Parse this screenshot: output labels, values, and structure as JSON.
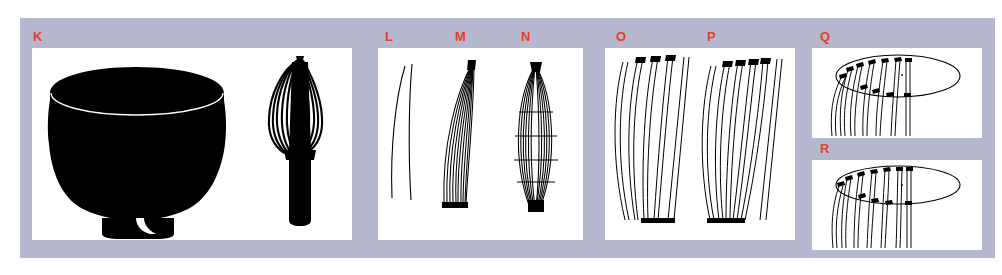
{
  "figure": {
    "kind": "archaeological-artifact-plate",
    "background_color": "#ffffff",
    "mount_color": "#b5b8cf",
    "panel_background": "#ffffff",
    "label_color": "#e8402a",
    "ink_color": "#000000",
    "width_px": 1002,
    "height_px": 275
  },
  "panels": [
    {
      "id": "K",
      "label": "K",
      "caption": "tea bowl and bamboo whisk silhouettes",
      "objects": [
        {
          "name": "chawan-bowl-silhouette",
          "description": "black tea bowl profile with white rim line and notched foot ring"
        },
        {
          "name": "chasen-whisk-silhouette",
          "description": "black bamboo tea whisk, flared tines over cylindrical handle"
        }
      ]
    },
    {
      "id": "L",
      "label": "L",
      "caption": "single tine outline",
      "objects": [
        {
          "name": "tine-outline-single",
          "description": "one slender curved tine drawn in outline"
        }
      ]
    },
    {
      "id": "M",
      "label": "M",
      "caption": "nested curved tine bundle",
      "objects": [
        {
          "name": "tine-bundle-curved",
          "description": "stack of nested curved tines forming a crescent"
        }
      ]
    },
    {
      "id": "N",
      "label": "N",
      "caption": "lens shaped opposed tine bundle",
      "objects": [
        {
          "name": "tine-bundle-lens",
          "description": "two mirrored tine bundles meeting at both ends forming a lens"
        }
      ]
    },
    {
      "id": "O",
      "label": "O",
      "caption": "sequence of five tine outlines with dark tips",
      "objects": [
        {
          "name": "tine-sequence-o",
          "count": 5,
          "description": "progressively straighter tines, dark terminal marks at top"
        }
      ]
    },
    {
      "id": "P",
      "label": "P",
      "caption": "sequence of six tine outlines with dark tips",
      "objects": [
        {
          "name": "tine-sequence-p",
          "count": 6,
          "description": "progressively straighter tines, dark terminal marks at top"
        }
      ]
    },
    {
      "id": "Q",
      "label": "Q",
      "caption": "oblique plan view, tines set around rim ellipse",
      "objects": [
        {
          "name": "rim-ellipse-q",
          "description": "ellipse representing the whisk rim seen obliquely"
        },
        {
          "name": "tine-set-q",
          "count": 7,
          "description": "curved tines descending from the left arc, dark attachment nodes"
        }
      ]
    },
    {
      "id": "R",
      "label": "R",
      "caption": "oblique plan view, straighter tine set around rim ellipse",
      "objects": [
        {
          "name": "rim-ellipse-r",
          "description": "ellipse representing the whisk rim seen obliquely"
        },
        {
          "name": "tine-set-r",
          "count": 7,
          "description": "near vertical tines descending from the left arc, dark attachment nodes"
        }
      ]
    }
  ]
}
